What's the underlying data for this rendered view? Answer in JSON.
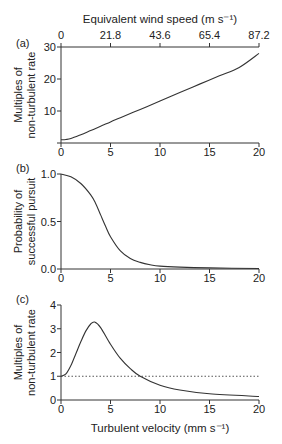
{
  "chart_data": [
    {
      "panel": "(a)",
      "type": "line",
      "top_axis": {
        "label": "Equivalent wind speed (m s⁻¹)",
        "ticks": [
          "0",
          "21.8",
          "43.6",
          "65.4",
          "87.2"
        ]
      },
      "ylabel": [
        "Multiples of",
        "non-turbulent rate"
      ],
      "yticks": [
        0,
        10,
        20,
        30
      ],
      "ytick_labels": [
        "",
        "10",
        "20",
        "30"
      ],
      "ylim": [
        0,
        30
      ],
      "xlim": [
        0,
        20
      ],
      "xticks": [
        0,
        5,
        10,
        15,
        20
      ],
      "xtick_labels": [
        "0",
        "5",
        "10",
        "15",
        "20"
      ],
      "x": [
        0,
        0.5,
        1,
        2,
        3,
        4,
        5,
        6,
        8,
        10,
        12,
        14,
        16,
        18,
        20
      ],
      "values": [
        1,
        1.1,
        1.4,
        2.6,
        3.9,
        5.2,
        6.6,
        7.9,
        10.5,
        13.1,
        15.8,
        18.4,
        21.0,
        23.6,
        28.0
      ]
    },
    {
      "panel": "(b)",
      "type": "line",
      "ylabel": [
        "Probability of",
        "successful pursuit"
      ],
      "yticks": [
        0,
        0.5,
        1.0
      ],
      "ytick_labels": [
        "0.0",
        "0.5",
        "1.0"
      ],
      "ylim": [
        0,
        1
      ],
      "xlim": [
        0,
        20
      ],
      "xticks": [
        0,
        5,
        10,
        15,
        20
      ],
      "xtick_labels": [
        "0",
        "5",
        "10",
        "15",
        "20"
      ],
      "x": [
        0,
        1,
        2,
        3,
        3.5,
        4,
        4.5,
        5,
        6,
        7,
        8,
        9,
        10,
        12,
        15,
        20
      ],
      "values": [
        1.0,
        0.97,
        0.9,
        0.78,
        0.69,
        0.57,
        0.45,
        0.34,
        0.19,
        0.11,
        0.07,
        0.045,
        0.03,
        0.02,
        0.012,
        0.005
      ]
    },
    {
      "panel": "(c)",
      "type": "line",
      "xlabel": "Turbulent velocity (mm s⁻¹)",
      "ylabel": [
        "Multiples of",
        "non-turbulent rate"
      ],
      "yticks": [
        0,
        1,
        2,
        3,
        4
      ],
      "ytick_labels": [
        "0",
        "1",
        "2",
        "3",
        "4"
      ],
      "ylim": [
        0,
        4
      ],
      "xlim": [
        0,
        20
      ],
      "xticks": [
        0,
        5,
        10,
        15,
        20
      ],
      "xtick_labels": [
        "0",
        "5",
        "10",
        "15",
        "20"
      ],
      "reference_line": {
        "y": 1,
        "style": "dotted"
      },
      "x": [
        0,
        0.5,
        1,
        1.5,
        2,
        2.5,
        3,
        3.4,
        4,
        5,
        6,
        7,
        8,
        10,
        12,
        15,
        20
      ],
      "values": [
        1.0,
        1.1,
        1.45,
        1.95,
        2.45,
        2.9,
        3.2,
        3.28,
        3.05,
        2.35,
        1.75,
        1.32,
        1.0,
        0.62,
        0.42,
        0.26,
        0.15
      ]
    }
  ]
}
